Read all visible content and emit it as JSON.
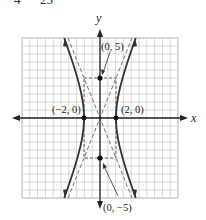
{
  "equation_fragment": {
    "left_denominator": "4",
    "right_denominator": "25"
  },
  "graph": {
    "x_axis_label": "x",
    "y_axis_label": "y",
    "grid": {
      "x_min": -10,
      "x_max": 10,
      "y_min": -10,
      "y_max": 10,
      "step": 1
    },
    "hyperbola": {
      "a": 2,
      "b": 5,
      "orientation": "horizontal",
      "equation": "x^2/4 - y^2/25 = 1"
    },
    "asymptotes": [
      "y = 5x/2",
      "y = -5x/2"
    ],
    "points": [
      {
        "label": "(0, 5)",
        "x": 0,
        "y": 5
      },
      {
        "label": "(0, −5)",
        "x": 0,
        "y": -5
      },
      {
        "label": "(−2, 0)",
        "x": -2,
        "y": 0
      },
      {
        "label": "(2, 0)",
        "x": 2,
        "y": 0
      }
    ],
    "colors": {
      "grid": "#c8c8c8",
      "curve": "#333333",
      "asymptote": "#777777",
      "axis": "#222222"
    }
  }
}
